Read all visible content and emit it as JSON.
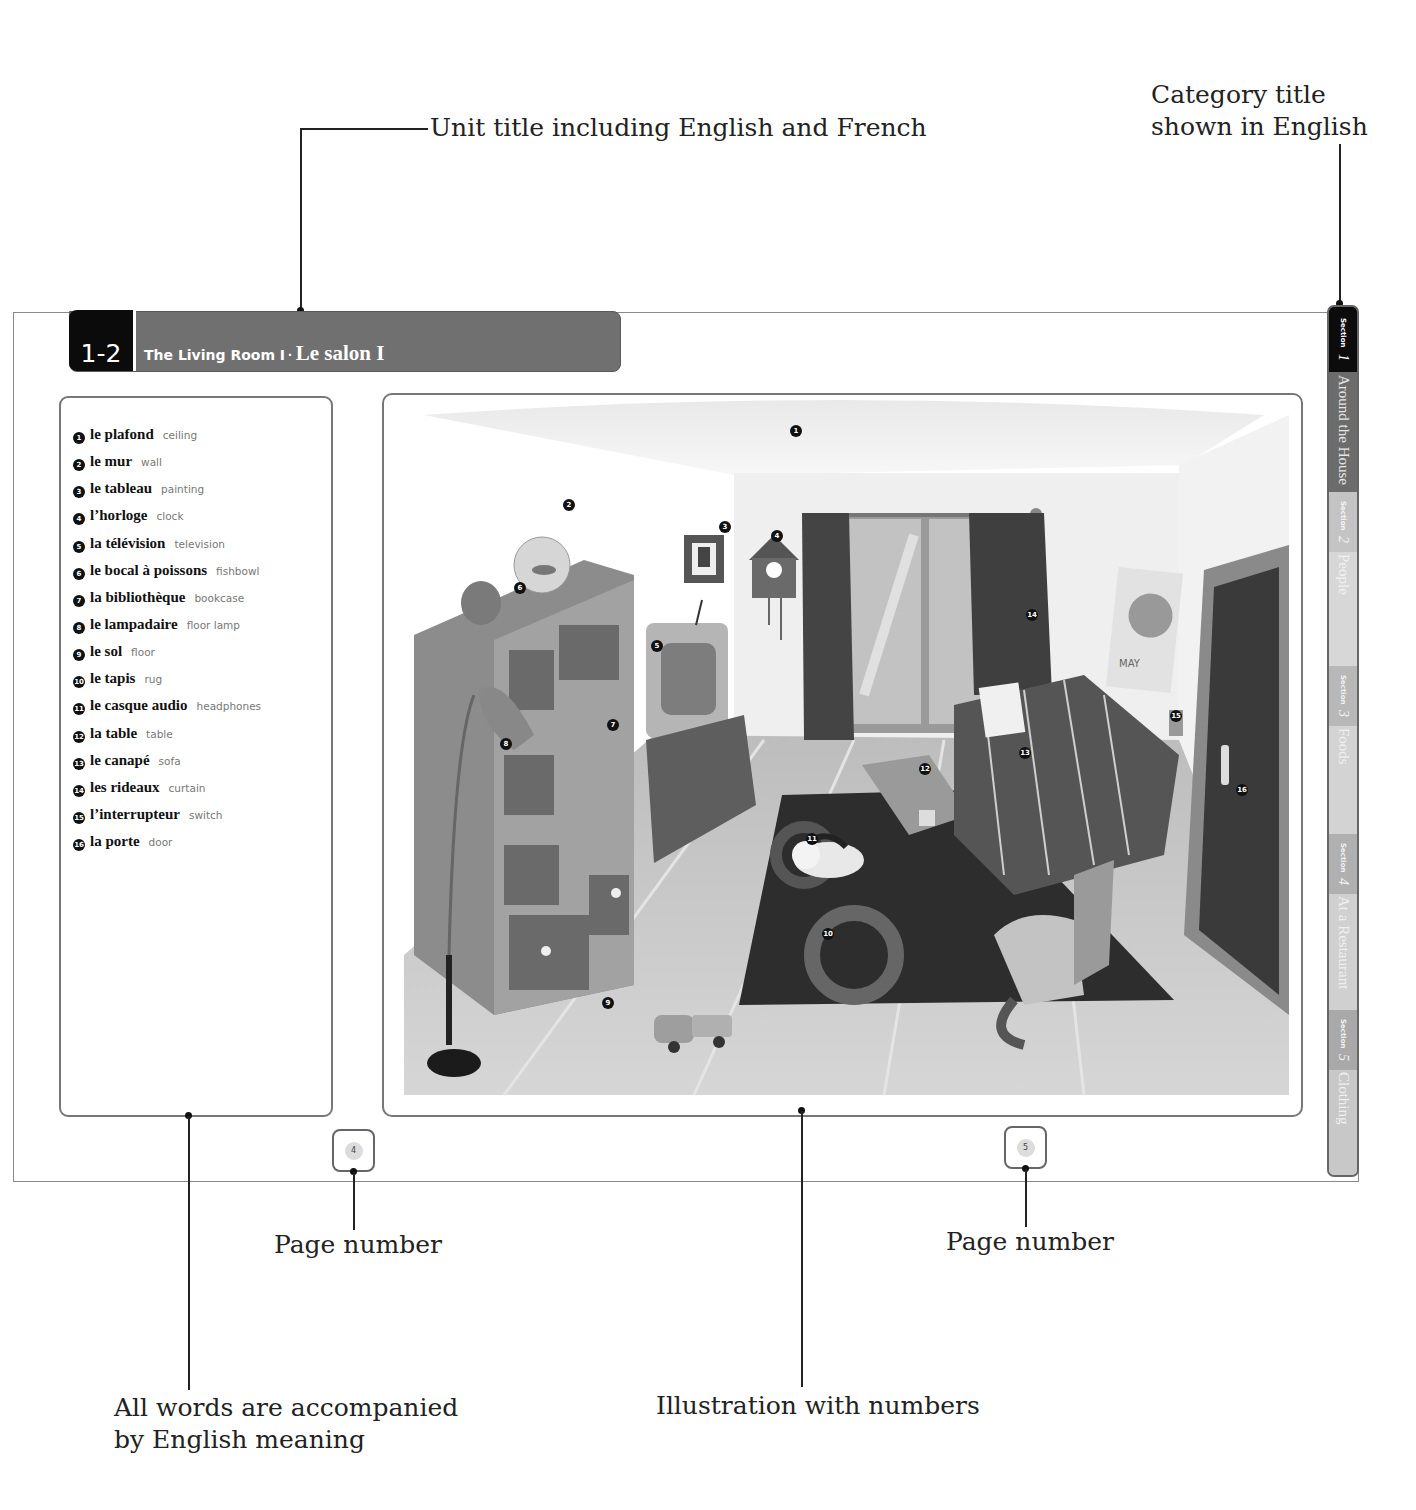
{
  "callouts": {
    "unit_title": "Unit title including English and French",
    "category_title_line1": "Category title",
    "category_title_line2": "shown in English",
    "page_number_left": "Page number",
    "page_number_right": "Page number",
    "words_line1": "All words are accompanied",
    "words_line2": "by English meaning",
    "illustration": "Illustration with numbers"
  },
  "unit": {
    "number": "1-2",
    "title_en": "The Living Room I",
    "separator": "·",
    "title_fr": "Le salon I"
  },
  "vocabulary": [
    {
      "num": "1",
      "fr": "le plafond",
      "en": "ceiling"
    },
    {
      "num": "2",
      "fr": "le mur",
      "en": "wall"
    },
    {
      "num": "3",
      "fr": "le tableau",
      "en": "painting"
    },
    {
      "num": "4",
      "fr": "l’horloge",
      "en": "clock"
    },
    {
      "num": "5",
      "fr": "la télévision",
      "en": "television"
    },
    {
      "num": "6",
      "fr": "le bocal à poissons",
      "en": "fishbowl"
    },
    {
      "num": "7",
      "fr": "la bibliothèque",
      "en": "bookcase"
    },
    {
      "num": "8",
      "fr": "le lampadaire",
      "en": "floor lamp"
    },
    {
      "num": "9",
      "fr": "le sol",
      "en": "floor"
    },
    {
      "num": "10",
      "fr": "le tapis",
      "en": "rug"
    },
    {
      "num": "11",
      "fr": "le casque audio",
      "en": "headphones"
    },
    {
      "num": "12",
      "fr": "la table",
      "en": "table"
    },
    {
      "num": "13",
      "fr": "le canapé",
      "en": "sofa"
    },
    {
      "num": "14",
      "fr": "les rideaux",
      "en": "curtain"
    },
    {
      "num": "15",
      "fr": "l’interrupteur",
      "en": "switch"
    },
    {
      "num": "16",
      "fr": "la porte",
      "en": "door"
    }
  ],
  "illustration": {
    "calendar_month": "MAY",
    "markers": [
      "1",
      "2",
      "3",
      "4",
      "5",
      "6",
      "7",
      "8",
      "9",
      "10",
      "11",
      "12",
      "13",
      "14",
      "15",
      "16"
    ]
  },
  "pages": {
    "left": "4",
    "right": "5"
  },
  "sections": [
    {
      "prefix": "Section",
      "num": "1",
      "label": "Around the House",
      "active": true
    },
    {
      "prefix": "Section",
      "num": "2",
      "label": "People",
      "active": false
    },
    {
      "prefix": "Section",
      "num": "3",
      "label": "Foods",
      "active": false
    },
    {
      "prefix": "Section",
      "num": "4",
      "label": "At a Restaurant",
      "active": false
    },
    {
      "prefix": "Section",
      "num": "5",
      "label": "Clothing",
      "active": false
    }
  ]
}
